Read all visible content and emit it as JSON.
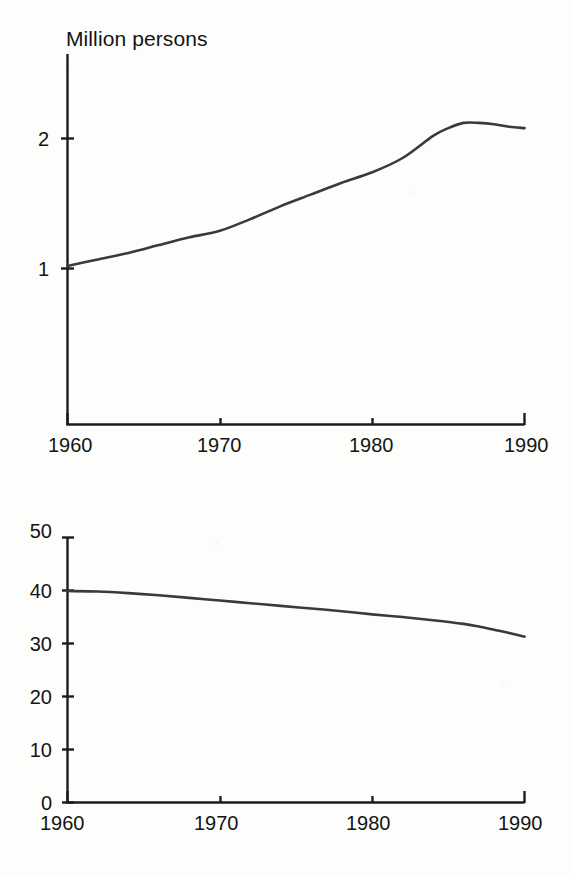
{
  "document": {
    "kind": "scanned-figure-page",
    "panel_count": 2
  },
  "chart_data": [
    {
      "id": "employment-millions",
      "type": "line",
      "title": "Million persons",
      "xlabel": "",
      "ylabel": "",
      "xlim": [
        1960,
        1990
      ],
      "ylim": [
        0.55,
        2.45
      ],
      "xticks": [
        1960,
        1970,
        1980,
        1990
      ],
      "xtick_labels": [
        "1960",
        "1970",
        "1980",
        "1990"
      ],
      "yticks": [
        1,
        2
      ],
      "ytick_labels": [
        "1",
        "2"
      ],
      "grid": false,
      "legend": "none",
      "series": [
        {
          "name": "Million persons",
          "x": [
            1960,
            1962,
            1964,
            1966,
            1968,
            1970,
            1972,
            1974,
            1976,
            1978,
            1980,
            1982,
            1984,
            1985,
            1986,
            1987,
            1988,
            1989,
            1990
          ],
          "values": [
            1.02,
            1.07,
            1.12,
            1.18,
            1.24,
            1.29,
            1.38,
            1.48,
            1.57,
            1.66,
            1.74,
            1.85,
            2.02,
            2.08,
            2.12,
            2.12,
            2.11,
            2.09,
            2.08
          ]
        }
      ]
    },
    {
      "id": "employment-percent",
      "type": "line",
      "title": "Percent of total employment",
      "xlabel": "",
      "ylabel": "",
      "xlim": [
        1960,
        1990
      ],
      "ylim": [
        0,
        50
      ],
      "xticks": [
        1960,
        1970,
        1980,
        1990
      ],
      "xtick_labels": [
        "1960",
        "1970",
        "1980",
        "1990"
      ],
      "yticks": [
        0,
        10,
        20,
        30,
        40,
        50
      ],
      "ytick_labels": [
        "0",
        "10",
        "20",
        "30",
        "40",
        "50"
      ],
      "grid": false,
      "legend": "none",
      "series": [
        {
          "name": "Percent of total employment",
          "x": [
            1960,
            1962,
            1964,
            1966,
            1968,
            1970,
            1972,
            1974,
            1976,
            1978,
            1980,
            1982,
            1984,
            1986,
            1987,
            1988,
            1989,
            1990
          ],
          "values": [
            39.9,
            39.8,
            39.5,
            39.1,
            38.6,
            38.1,
            37.6,
            37.1,
            36.6,
            36.1,
            35.5,
            35.0,
            34.4,
            33.7,
            33.2,
            32.6,
            32.0,
            31.3
          ]
        }
      ]
    }
  ],
  "colors": {
    "line": "#3a3a3a",
    "axis": "#1c1c1c",
    "text": "#141414",
    "background": "#fdfdfc"
  }
}
